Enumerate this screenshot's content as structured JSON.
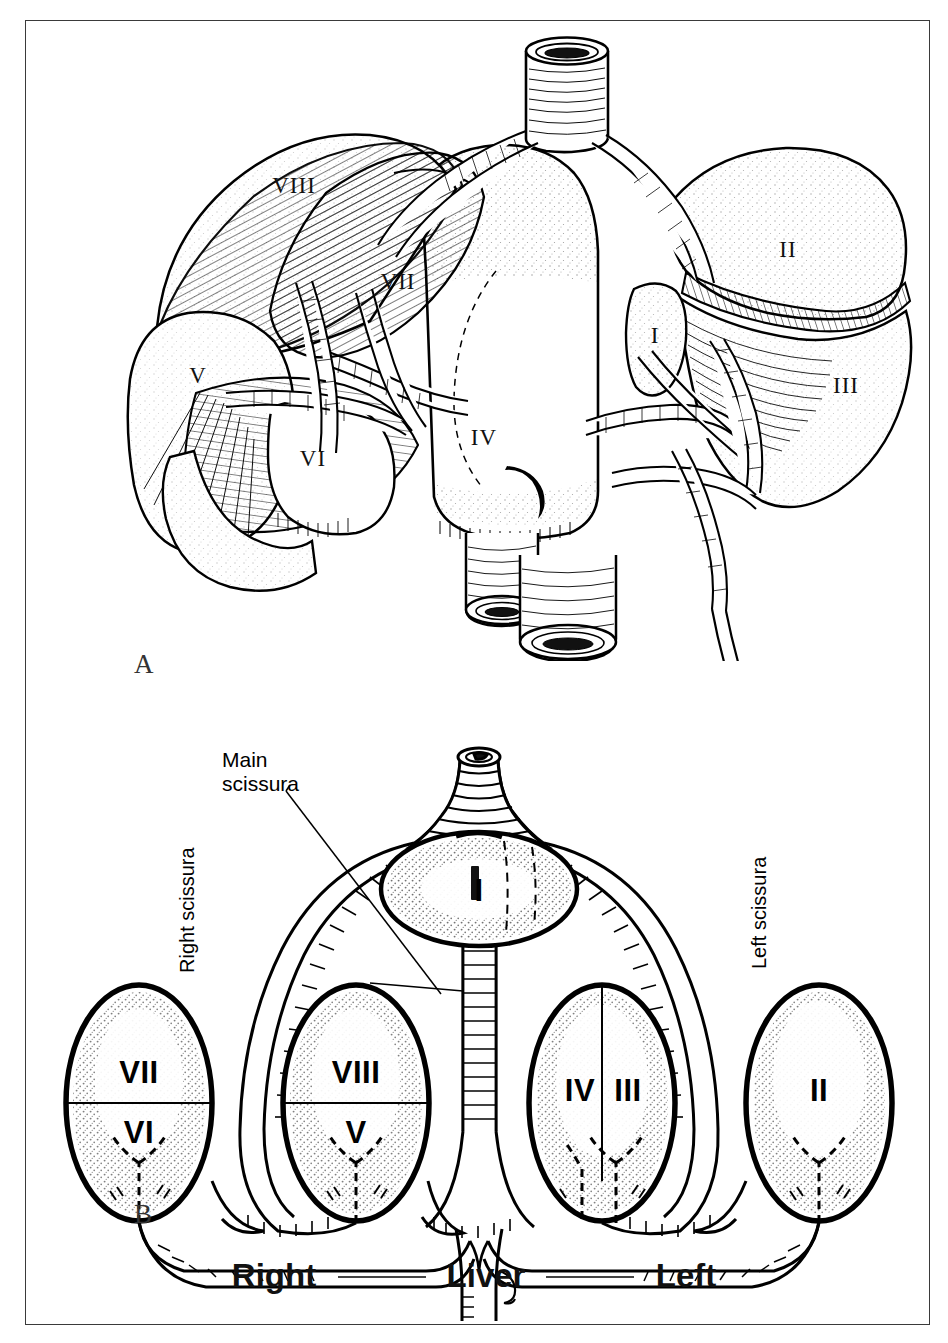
{
  "figure": {
    "background": "#ffffff",
    "ink_color": "#000000",
    "border_color": "#3a3a3a"
  },
  "panels": [
    {
      "id": "A",
      "letter": "A",
      "caption": "",
      "type": "perspective-anatomical-drawing",
      "segment_labels": [
        {
          "text": "VIII",
          "x": 268,
          "y": 172
        },
        {
          "text": "VII",
          "x": 372,
          "y": 268
        },
        {
          "text": "V",
          "x": 172,
          "y": 362
        },
        {
          "text": "VI",
          "x": 287,
          "y": 445
        },
        {
          "text": "IV",
          "x": 458,
          "y": 424
        },
        {
          "text": "I",
          "x": 645,
          "y": 322
        },
        {
          "text": "II",
          "x": 762,
          "y": 236
        },
        {
          "text": "III",
          "x": 820,
          "y": 372
        }
      ]
    },
    {
      "id": "B",
      "letter": "B",
      "caption": "",
      "type": "schematic-diagram",
      "annotations": [
        {
          "name": "main-scissura",
          "text": "Main\nscissura",
          "lines": [
            "Main",
            "scissura"
          ],
          "rotation": 0
        },
        {
          "name": "right-scissura",
          "text": "Right scissura",
          "rotation": -90
        },
        {
          "name": "left-scissura",
          "text": "Left scissura",
          "rotation": -90
        }
      ],
      "segment_labels": [
        {
          "text": "I",
          "group": "caudate"
        },
        {
          "text": "VII",
          "group": "right-lateral-upper"
        },
        {
          "text": "VI",
          "group": "right-lateral-lower"
        },
        {
          "text": "VIII",
          "group": "right-medial-upper"
        },
        {
          "text": "V",
          "group": "right-medial-lower"
        },
        {
          "text": "IV",
          "group": "left-medial"
        },
        {
          "text": "III",
          "group": "left-lateral-lower"
        },
        {
          "text": "II",
          "group": "left-lateral-upper"
        }
      ],
      "footer": {
        "left_word": "Right",
        "center_word": "Liver",
        "right_word": "Left",
        "separator": "line"
      }
    }
  ]
}
